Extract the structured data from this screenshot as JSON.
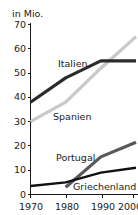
{
  "chart_data": {
    "type": "line",
    "title": "",
    "subtitle": "",
    "xlabel": "",
    "ylabel": "in Mio.",
    "unit_label": "in Mio.",
    "x": [
      1970,
      1980,
      1990,
      2000
    ],
    "xtick_labels": [
      "1970",
      "1980",
      "1990",
      "2000"
    ],
    "xlim": [
      1970,
      2000
    ],
    "ylim": [
      0,
      70
    ],
    "yticks": [
      0,
      10,
      20,
      30,
      40,
      50,
      60,
      70
    ],
    "ytick_labels": [
      "0",
      "10",
      "20",
      "30",
      "40",
      "50",
      "60",
      "70"
    ],
    "grid": false,
    "legend_position": "inline-annotations",
    "series": [
      {
        "name": "Italien",
        "label": "Italien",
        "color": "#2b2b2b",
        "x": [
          1970,
          1980,
          1990,
          2000
        ],
        "values": [
          38,
          48,
          55,
          55
        ]
      },
      {
        "name": "Spanien",
        "label": "Spanien",
        "color": "#c8c8c8",
        "x": [
          1970,
          1980,
          1990,
          2000
        ],
        "values": [
          30,
          38,
          52,
          65
        ]
      },
      {
        "name": "Portugal",
        "label": "Portugal",
        "color": "#595959",
        "x": [
          1980,
          1990,
          2000
        ],
        "values": [
          3,
          15.5,
          21.5
        ]
      },
      {
        "name": "Griechenland",
        "label": "Griechenland",
        "color": "#111111",
        "x": [
          1970,
          1980,
          1990,
          2000
        ],
        "values": [
          3.5,
          5,
          9,
          11
        ]
      }
    ],
    "annotations": [
      {
        "text": "Italien",
        "x": 1970,
        "y": 56
      },
      {
        "text": "Spanien",
        "x": 1972,
        "y": 33
      },
      {
        "text": "Portugal",
        "x": 1977,
        "y": 15
      },
      {
        "text": "Griechenland",
        "x": 1987,
        "y": 3
      }
    ]
  },
  "labels": {
    "unit": "in Mio.",
    "y_0": "0",
    "y_10": "10",
    "y_20": "20",
    "y_30": "30",
    "y_40": "40",
    "y_50": "50",
    "y_60": "60",
    "y_70": "70",
    "x_1970": "1970",
    "x_1980": "1980",
    "x_1990": "1990",
    "x_2000": "2000",
    "series_italien": "Italien",
    "series_spanien": "Spanien",
    "series_portugal": "Portugal",
    "series_griechenland": "Griechenland"
  }
}
